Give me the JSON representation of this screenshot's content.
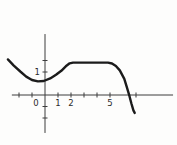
{
  "figure": {
    "background": "#fdfdfc",
    "curve_color": "#1b1b1b",
    "axis_color": "#3d3d3d",
    "label_color": "#2b2b2b"
  },
  "chart_data": {
    "type": "line",
    "title": "",
    "xlabel": "",
    "ylabel": "",
    "grid": false,
    "legend": false,
    "canvas_px": [
      177,
      145
    ],
    "origin_px": [
      45,
      95
    ],
    "unit_px": [
      13,
      23
    ],
    "x_axis": {
      "range": [
        -2.55,
        9.85
      ],
      "labeled_ticks": [
        {
          "value": 0,
          "label": "0"
        },
        {
          "value": 1,
          "label": "1"
        },
        {
          "value": 2,
          "label": "2"
        },
        {
          "value": 5,
          "label": "5"
        }
      ],
      "unlabeled_ticks": [
        -2,
        -1,
        3,
        4,
        7
      ]
    },
    "y_axis": {
      "range": [
        -1.65,
        2.65
      ],
      "labeled_ticks": [
        {
          "value": 1,
          "label": "1"
        }
      ],
      "unlabeled_ticks": [
        1.5,
        -0.5,
        -1
      ]
    },
    "series": [
      {
        "name": "f(x)",
        "points": [
          [
            -2.85,
            1.55
          ],
          [
            -2.4,
            1.28
          ],
          [
            -1.9,
            1.02
          ],
          [
            -1.45,
            0.8
          ],
          [
            -1.0,
            0.65
          ],
          [
            -0.55,
            0.59
          ],
          [
            -0.1,
            0.61
          ],
          [
            0.4,
            0.72
          ],
          [
            0.85,
            0.88
          ],
          [
            1.25,
            1.05
          ],
          [
            1.6,
            1.25
          ],
          [
            1.9,
            1.38
          ],
          [
            2.15,
            1.41
          ],
          [
            4.85,
            1.41
          ],
          [
            5.15,
            1.37
          ],
          [
            5.45,
            1.26
          ],
          [
            5.75,
            1.07
          ],
          [
            6.1,
            0.7
          ],
          [
            6.3,
            0.33
          ],
          [
            6.5,
            -0.05
          ],
          [
            6.65,
            -0.37
          ],
          [
            6.8,
            -0.67
          ],
          [
            6.9,
            -0.78
          ]
        ]
      }
    ]
  }
}
